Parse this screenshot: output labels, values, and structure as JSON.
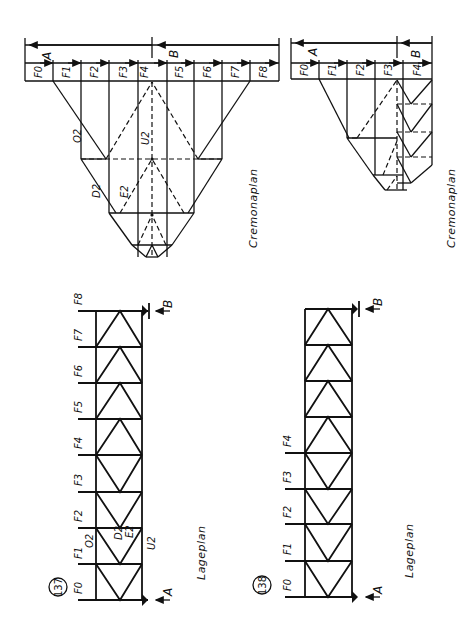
{
  "figures": [
    {
      "number": "137",
      "lageplan": {
        "caption": "Lageplan",
        "loads": [
          "F0",
          "F1",
          "F2",
          "F3",
          "F4",
          "F5",
          "F6",
          "F7",
          "F8"
        ],
        "supports": [
          "A",
          "B"
        ],
        "member_labels": [
          "O2",
          "D2",
          "E2",
          "U2"
        ]
      },
      "cremonaplan": {
        "caption": "Cremonaplan",
        "force_segments": [
          "F0",
          "F1",
          "F2",
          "F3",
          "F4",
          "F5",
          "F6",
          "F7",
          "F8"
        ],
        "reactions": [
          "A",
          "B"
        ],
        "member_labels": [
          "O2",
          "U2",
          "D2",
          "E2"
        ]
      }
    },
    {
      "number": "138",
      "lageplan": {
        "caption": "Lageplan",
        "loads": [
          "F0",
          "F1",
          "F2",
          "F3",
          "F4"
        ],
        "supports": [
          "A",
          "B"
        ]
      },
      "cremonaplan": {
        "caption": "Cremonaplan",
        "force_segments": [
          "F0",
          "F1",
          "F2",
          "F3",
          "F4"
        ],
        "reactions": [
          "A",
          "B"
        ]
      }
    }
  ],
  "labels": {
    "fig137": "137",
    "fig138": "138",
    "lageplan": "Lageplan",
    "cremonaplan": "Cremonaplan",
    "A": "A",
    "B": "B",
    "F0": "F0",
    "F1": "F1",
    "F2": "F2",
    "F3": "F3",
    "F4": "F4",
    "F5": "F5",
    "F6": "F6",
    "F7": "F7",
    "F8": "F8",
    "O2": "O2",
    "U2": "U2",
    "D2": "D2",
    "E2": "E2"
  }
}
